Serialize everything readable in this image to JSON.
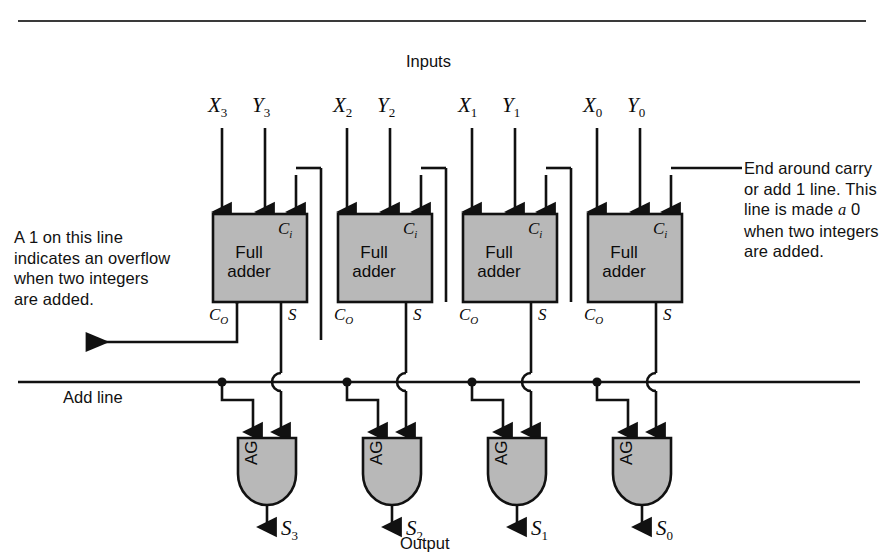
{
  "figure": {
    "title_top": "Inputs",
    "title_bottom": "Output",
    "fill_gray": "#b8b8b8",
    "line_color": "#111111",
    "background": "#ffffff"
  },
  "inputs": [
    {
      "x": "X",
      "x_sub": "3",
      "y": "Y",
      "y_sub": "3"
    },
    {
      "x": "X",
      "x_sub": "2",
      "y": "Y",
      "y_sub": "2"
    },
    {
      "x": "X",
      "x_sub": "1",
      "y": "Y",
      "y_sub": "1"
    },
    {
      "x": "X",
      "x_sub": "0",
      "y": "Y",
      "y_sub": "0"
    }
  ],
  "adders": [
    {
      "label_line1": "Full",
      "label_line2": "adder",
      "ci": "C",
      "ci_sub": "i",
      "co": "C",
      "co_sub": "O",
      "s": "S"
    },
    {
      "label_line1": "Full",
      "label_line2": "adder",
      "ci": "C",
      "ci_sub": "i",
      "co": "C",
      "co_sub": "O",
      "s": "S"
    },
    {
      "label_line1": "Full",
      "label_line2": "adder",
      "ci": "C",
      "ci_sub": "i",
      "co": "C",
      "co_sub": "O",
      "s": "S"
    },
    {
      "label_line1": "Full",
      "label_line2": "adder",
      "ci": "C",
      "ci_sub": "i",
      "co": "C",
      "co_sub": "O",
      "s": "S"
    }
  ],
  "gates": [
    {
      "label": "AG",
      "out": "S",
      "out_sub": "3"
    },
    {
      "label": "AG",
      "out": "S",
      "out_sub": "2"
    },
    {
      "label": "AG",
      "out": "S",
      "out_sub": "1"
    },
    {
      "label": "AG",
      "out": "S",
      "out_sub": "0"
    }
  ],
  "add_line_label": "Add line",
  "annotations": {
    "overflow": {
      "line1": "A 1 on this line",
      "line2": "indicates an overflow",
      "line3": "when two integers",
      "line4": "are added."
    },
    "end_carry": {
      "line1": "End around carry",
      "line2": "or add 1 line. This",
      "line3_a": "line is made ",
      "line3_italic": "a",
      "line3_b": " 0",
      "line4": "when two integers",
      "line5": "are added."
    }
  }
}
